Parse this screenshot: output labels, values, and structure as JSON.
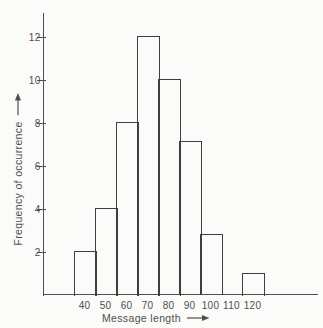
{
  "figure": {
    "background": "#fbfbf9",
    "bar_line_color": "#3e3e3e",
    "axis_color": "#4e4e4e",
    "text_color": "#4f4f4f"
  },
  "chart_data": {
    "type": "bar",
    "subtype": "histogram",
    "title": "",
    "xlabel": "Message length",
    "ylabel": "Frequency of occurrence",
    "categories": [
      40,
      50,
      60,
      70,
      80,
      90,
      100,
      110,
      120
    ],
    "values": [
      2,
      4,
      8,
      12,
      10,
      7.1,
      2.8,
      0,
      1
    ],
    "yticks": [
      2,
      4,
      6,
      8,
      10,
      12
    ],
    "ylim": [
      0,
      13.1
    ],
    "xlim": [
      35,
      130
    ],
    "grid": false,
    "legend": null,
    "bar_fill": "none",
    "axis_arrows": true
  }
}
